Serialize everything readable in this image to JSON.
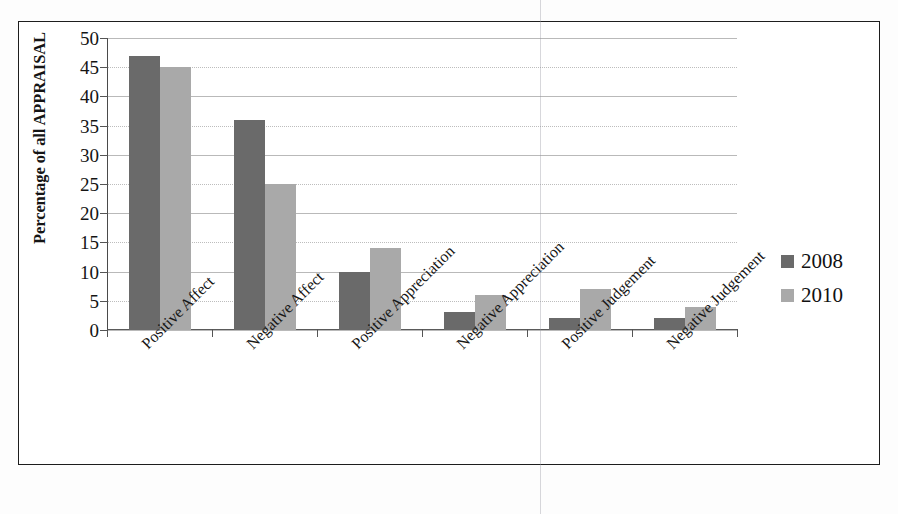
{
  "chart_data": {
    "type": "bar",
    "title": "",
    "subtitle": "",
    "xlabel": "",
    "ylabel": "Percentage of all APPRAISAL",
    "ylim": [
      0,
      50
    ],
    "ytick_step": 5,
    "yticks": [
      "50",
      "45",
      "40",
      "35",
      "30",
      "25",
      "20",
      "15",
      "10",
      "5",
      "0"
    ],
    "grid": true,
    "legend_position": "right",
    "categories": [
      "Positive Affect",
      "Negative Affect",
      "Positive Appreciation",
      "Negative Appreciation",
      "Positive Judgement",
      "Negative Judgement"
    ],
    "series": [
      {
        "name": "2008",
        "color": "#6a6a6a",
        "values": [
          47,
          36,
          10,
          3,
          2,
          2
        ]
      },
      {
        "name": "2010",
        "color": "#a9a9a9",
        "values": [
          45,
          25,
          14,
          6,
          7,
          4
        ]
      }
    ]
  },
  "legend": {
    "items": [
      {
        "label": "2008",
        "color": "#6a6a6a"
      },
      {
        "label": "2010",
        "color": "#a9a9a9"
      }
    ]
  },
  "colors": {
    "series_2008": "#6a6a6a",
    "series_2010": "#a9a9a9",
    "frame": "#1d1d1d",
    "grid": "#b9b9b9",
    "text": "#141414",
    "background": "#ffffff"
  }
}
